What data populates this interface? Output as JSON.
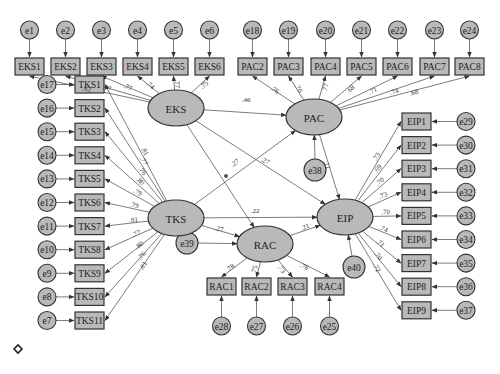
{
  "diagram": {
    "type": "structural-equation-model",
    "latents": [
      {
        "id": "EKS",
        "label": "EKS",
        "cx": 176,
        "cy": 108
      },
      {
        "id": "PAC",
        "label": "PAC",
        "cx": 314,
        "cy": 117
      },
      {
        "id": "TKS",
        "label": "TKS",
        "cx": 176,
        "cy": 218
      },
      {
        "id": "RAC",
        "label": "RAC",
        "cx": 265,
        "cy": 244
      },
      {
        "id": "EIP",
        "label": "EIP",
        "cx": 345,
        "cy": 217
      }
    ],
    "indicators": {
      "EKS": [
        {
          "label": "EKS1",
          "error": "e1",
          "loading": ".82"
        },
        {
          "label": "EKS2",
          "error": "e2",
          "loading": ".77"
        },
        {
          "label": "EKS3",
          "error": "e3",
          "loading": ".77"
        },
        {
          "label": "EKS4",
          "error": "e4",
          "loading": ".74"
        },
        {
          "label": "EKS5",
          "error": "e5",
          "loading": ".77"
        },
        {
          "label": "EKS6",
          "error": "e6",
          "loading": ".75"
        }
      ],
      "PAC": [
        {
          "label": "PAC2",
          "error": "e18",
          "loading": ".76"
        },
        {
          "label": "PAC3",
          "error": "e19",
          "loading": ".70"
        },
        {
          "label": "PAC4",
          "error": "e20",
          "loading": ".77"
        },
        {
          "label": "PAC5",
          "error": "e21",
          "loading": ".68"
        },
        {
          "label": "PAC6",
          "error": "e22",
          "loading": ".71"
        },
        {
          "label": "PAC7",
          "error": "e23",
          "loading": ".74"
        },
        {
          "label": "PAC8",
          "error": "e24",
          "loading": ".68"
        }
      ],
      "TKS": [
        {
          "label": "TKS1",
          "error": "e17",
          "loading": ".81"
        },
        {
          "label": "TKS2",
          "error": "e16",
          "loading": ".77"
        },
        {
          "label": "TKS3",
          "error": "e15",
          "loading": ".76"
        },
        {
          "label": "TKS4",
          "error": "e14",
          "loading": ".80"
        },
        {
          "label": "TKS5",
          "error": "e13",
          "loading": ".79"
        },
        {
          "label": "TKS6",
          "error": "e12",
          "loading": ".79"
        },
        {
          "label": "TKS7",
          "error": "e11",
          "loading": ".81"
        },
        {
          "label": "TKS8",
          "error": "e10",
          "loading": ".77"
        },
        {
          "label": "TKS9",
          "error": "e9",
          "loading": ".80"
        },
        {
          "label": "TKS10",
          "error": "e8",
          "loading": ".76"
        },
        {
          "label": "TKS11",
          "error": "e7",
          "loading": ".81"
        }
      ],
      "EIP": [
        {
          "label": "EIP1",
          "error": "e29",
          "loading": ".73"
        },
        {
          "label": "EIP2",
          "error": "e30",
          "loading": ".69"
        },
        {
          "label": "EIP3",
          "error": "e31",
          "loading": ".70"
        },
        {
          "label": "EIP4",
          "error": "e32",
          "loading": ".73"
        },
        {
          "label": "EIP5",
          "error": "e33",
          "loading": ".70"
        },
        {
          "label": "EIP6",
          "error": "e34",
          "loading": ".74"
        },
        {
          "label": "EIP7",
          "error": "e35",
          "loading": ".71"
        },
        {
          "label": "EIP8",
          "error": "e36",
          "loading": ".70"
        },
        {
          "label": "EIP9",
          "error": "e37",
          "loading": ".72"
        }
      ],
      "RAC": [
        {
          "label": "RAC1",
          "error": "e28",
          "loading": ".78"
        },
        {
          "label": "RAC2",
          "error": "e27",
          "loading": ".75"
        },
        {
          "label": "RAC3",
          "error": "e26",
          "loading": ".73"
        },
        {
          "label": "RAC4",
          "error": "e25",
          "loading": ".76"
        }
      ]
    },
    "structural_paths": [
      {
        "from": "EKS",
        "to": "PAC",
        "coef": ".46"
      },
      {
        "from": "EKS",
        "to": "EIP",
        "coef": ".27"
      },
      {
        "from": "EKS",
        "to": "RAC",
        "coef": ""
      },
      {
        "from": "TKS",
        "to": "PAC",
        "coef": ".27"
      },
      {
        "from": "TKS",
        "to": "EIP",
        "coef": ".22"
      },
      {
        "from": "TKS",
        "to": "RAC",
        "coef": ".27"
      },
      {
        "from": "RAC",
        "to": "EIP",
        "coef": ".21"
      },
      {
        "from": "PAC",
        "to": "EIP",
        "coef": ".11"
      }
    ],
    "disturbances": [
      {
        "label": "e38",
        "target": "PAC"
      },
      {
        "label": "e39",
        "target": "RAC"
      },
      {
        "label": "e40",
        "target": "EIP"
      }
    ]
  }
}
